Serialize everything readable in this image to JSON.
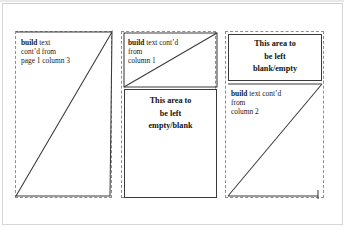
{
  "figure": {
    "type": "page-layout-diagram",
    "ink_color": "#3a3a3a",
    "guide_color": "#8d8d8d",
    "page_bg": "#ffffff"
  },
  "columns": [
    {
      "id": "column-1",
      "blocks": [
        {
          "id": "col1-build-block",
          "kind": "build-shape",
          "lines": [
            {
              "bold": "build",
              "rest": " text"
            },
            {
              "bold": "",
              "rest": "cont’d from"
            },
            {
              "bold": "",
              "rest": "page 1 column 3"
            }
          ]
        }
      ]
    },
    {
      "id": "column-2",
      "blocks": [
        {
          "id": "col2-build-block",
          "kind": "build-shape",
          "lines": [
            {
              "bold": "build",
              "rest": " text cont’d"
            },
            {
              "bold": "",
              "rest": "from"
            },
            {
              "bold": "",
              "rest": "column 1"
            }
          ]
        },
        {
          "id": "col2-blank-block",
          "kind": "blank-box",
          "label_lines": [
            "This area to",
            "be left",
            "empty/blank"
          ]
        }
      ]
    },
    {
      "id": "column-3",
      "blocks": [
        {
          "id": "col3-blank-block",
          "kind": "blank-box",
          "label_lines": [
            "This area to",
            "be left",
            "blank/empty"
          ]
        },
        {
          "id": "col3-build-block",
          "kind": "build-shape",
          "lines": [
            {
              "bold": "build",
              "rest": " text cont’d"
            },
            {
              "bold": "",
              "rest": "from"
            },
            {
              "bold": "",
              "rest": "column 2"
            }
          ]
        }
      ]
    }
  ]
}
